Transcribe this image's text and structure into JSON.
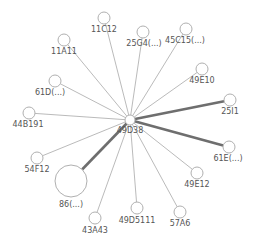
{
  "diagram": {
    "type": "network-graph",
    "hub": {
      "id": "49D38",
      "label": "49D38",
      "x": 130,
      "y": 120,
      "r": 5
    },
    "nodes": [
      {
        "id": "11C12",
        "label": "11C12",
        "x": 104,
        "y": 18,
        "r": 6,
        "lx": 104,
        "ly": 32,
        "weight": "thin"
      },
      {
        "id": "11A11",
        "label": "11A11",
        "x": 64,
        "y": 40,
        "r": 6,
        "lx": 64,
        "ly": 54,
        "weight": "thin"
      },
      {
        "id": "25G4",
        "label": "25G4(...)",
        "x": 143,
        "y": 32,
        "r": 6,
        "lx": 144,
        "ly": 46,
        "weight": "thin"
      },
      {
        "id": "45C15",
        "label": "45C15(...)",
        "x": 186,
        "y": 29,
        "r": 6,
        "lx": 185,
        "ly": 43,
        "weight": "thin"
      },
      {
        "id": "49E10",
        "label": "49E10",
        "x": 202,
        "y": 69,
        "r": 6,
        "lx": 202,
        "ly": 83,
        "weight": "thin"
      },
      {
        "id": "25I1",
        "label": "25I1",
        "x": 230,
        "y": 100,
        "r": 6,
        "lx": 230,
        "ly": 114,
        "weight": "thick"
      },
      {
        "id": "61E",
        "label": "61E(...)",
        "x": 229,
        "y": 147,
        "r": 6,
        "lx": 228,
        "ly": 161,
        "weight": "thick"
      },
      {
        "id": "49E12",
        "label": "49E12",
        "x": 197,
        "y": 173,
        "r": 6,
        "lx": 197,
        "ly": 187,
        "weight": "thin"
      },
      {
        "id": "57A6",
        "label": "57A6",
        "x": 180,
        "y": 212,
        "r": 6,
        "lx": 180,
        "ly": 226,
        "weight": "thin"
      },
      {
        "id": "49D5111",
        "label": "49D5111",
        "x": 137,
        "y": 208,
        "r": 6,
        "lx": 137,
        "ly": 223,
        "weight": "thin"
      },
      {
        "id": "43A43",
        "label": "43A43",
        "x": 95,
        "y": 218,
        "r": 6,
        "lx": 95,
        "ly": 233,
        "weight": "thin"
      },
      {
        "id": "86",
        "label": "86(...)",
        "x": 71,
        "y": 181,
        "r": 16,
        "lx": 71,
        "ly": 207,
        "weight": "thick"
      },
      {
        "id": "54F12",
        "label": "54F12",
        "x": 37,
        "y": 158,
        "r": 6,
        "lx": 37,
        "ly": 172,
        "weight": "thin"
      },
      {
        "id": "44B191",
        "label": "44B191",
        "x": 29,
        "y": 113,
        "r": 6,
        "lx": 28,
        "ly": 127,
        "weight": "thin"
      },
      {
        "id": "61D",
        "label": "61D(...)",
        "x": 55,
        "y": 81,
        "r": 6,
        "lx": 50,
        "ly": 95,
        "weight": "thin"
      }
    ],
    "colors": {
      "node_stroke": "#b0b0b0",
      "thin_edge": "#a8a8a8",
      "thick_edge": "#6e6e6e",
      "label": "#555555",
      "background": "#ffffff"
    }
  }
}
